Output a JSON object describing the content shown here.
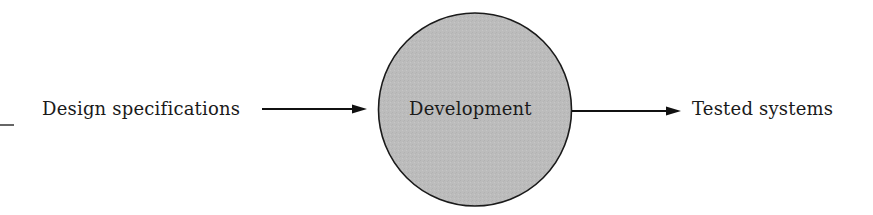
{
  "diagram": {
    "type": "data-flow",
    "input": {
      "label": "Design specifications"
    },
    "process": {
      "label": "Development",
      "shape": "circle",
      "fill_color": "#bcbcbc",
      "stroke_color": "#1a1a1a"
    },
    "output": {
      "label": "Tested systems"
    },
    "edges": [
      {
        "from": "Design specifications",
        "to": "Development"
      },
      {
        "from": "Development",
        "to": "Tested systems"
      }
    ]
  }
}
